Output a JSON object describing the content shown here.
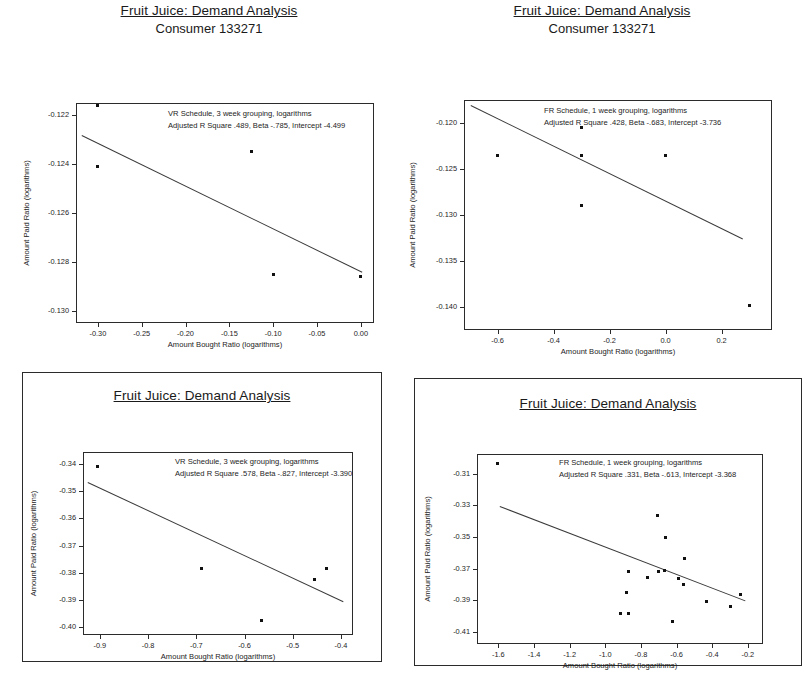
{
  "document": {
    "background_color": "#ffffff",
    "axis_color": "#2b2b2b",
    "marker_color": "#111111",
    "line_color": "#3a3a3a"
  },
  "charts": [
    {
      "id": "top-left",
      "title": "Fruit Juice: Demand Analysis",
      "subtitle": "Consumer 133271",
      "annotation_line1": "VR Schedule, 3 week grouping, logarithms",
      "annotation_line2": "Adjusted R Square .489, Beta -.785, Intercept -4.499",
      "xlabel": "Amount Bought Ratio (logarithms)",
      "ylabel": "Amount Paid Ratio (logarithms)",
      "xticks": [
        "-0.30",
        "-0.25",
        "-0.20",
        "-0.15",
        "-0.10",
        "-0.05",
        "0.00"
      ],
      "xtick_values": [
        -0.3,
        -0.25,
        -0.2,
        -0.15,
        -0.1,
        -0.05,
        0.0
      ],
      "yticks": [
        "-0.122",
        "-0.124",
        "-0.126",
        "-0.128",
        "-0.130"
      ],
      "ytick_values": [
        -0.122,
        -0.124,
        -0.126,
        -0.128,
        -0.13
      ],
      "xlim": [
        -0.325,
        0.015
      ],
      "ylim": [
        -0.1305,
        -0.1215
      ],
      "points": [
        {
          "x": -0.3,
          "y": -0.1216
        },
        {
          "x": -0.3,
          "y": -0.1241
        },
        {
          "x": -0.125,
          "y": -0.1235
        },
        {
          "x": -0.1,
          "y": -0.1285
        },
        {
          "x": 0.0,
          "y": -0.1286
        }
      ],
      "fit": {
        "x1": -0.318,
        "y1": -0.1228,
        "x2": 0.002,
        "y2": -0.1284
      }
    },
    {
      "id": "top-right",
      "title": "Fruit Juice: Demand Analysis",
      "subtitle": "Consumer 133271",
      "annotation_line1": "FR Schedule, 1 week grouping, logarithms",
      "annotation_line2": "Adjusted R Square .428, Beta -.683, Intercept -3.736",
      "xlabel": "Amount Bought Ratio (logarithms)",
      "ylabel": "Amount Paid Ratio (logarithms)",
      "xticks": [
        "-0.6",
        "-0.4",
        "-0.2",
        "0.0",
        "0.2"
      ],
      "xtick_values": [
        -0.6,
        -0.4,
        -0.2,
        0.0,
        0.2
      ],
      "yticks": [
        "-0.120",
        "-0.125",
        "-0.130",
        "-0.135",
        "-0.140"
      ],
      "ytick_values": [
        -0.12,
        -0.125,
        -0.13,
        -0.135,
        -0.14
      ],
      "xlim": [
        -0.72,
        0.38
      ],
      "ylim": [
        -0.1425,
        -0.1175
      ],
      "points": [
        {
          "x": -0.6,
          "y": -0.1235
        },
        {
          "x": -0.3,
          "y": -0.1205
        },
        {
          "x": -0.3,
          "y": -0.1235
        },
        {
          "x": -0.3,
          "y": -0.129
        },
        {
          "x": 0.0,
          "y": -0.1235
        },
        {
          "x": 0.3,
          "y": -0.1398
        }
      ],
      "fit": {
        "x1": -0.695,
        "y1": -0.118,
        "x2": 0.275,
        "y2": -0.1325
      }
    },
    {
      "id": "bottom-left",
      "title": "Fruit Juice: Demand Analysis",
      "subtitle": "",
      "annotation_line1": "VR Schedule, 3 week grouping, logarithms",
      "annotation_line2": "Adjusted R Square .578, Beta -.827, Intercept -3.390",
      "xlabel": "Amount Bought Ratio (logarithms)",
      "ylabel": "Amount Paid Ratio (logarithms)",
      "xticks": [
        "-0.9",
        "-0.8",
        "-0.7",
        "-0.6",
        "-0.5",
        "-0.4"
      ],
      "xtick_values": [
        -0.9,
        -0.8,
        -0.7,
        -0.6,
        -0.5,
        -0.4
      ],
      "yticks": [
        "-0.34",
        "-0.35",
        "-0.36",
        "-0.37",
        "-0.38",
        "-0.39",
        "-0.40"
      ],
      "ytick_values": [
        -0.34,
        -0.35,
        -0.36,
        -0.37,
        -0.38,
        -0.39,
        -0.4
      ],
      "xlim": [
        -0.935,
        -0.375
      ],
      "ylim": [
        -0.403,
        -0.3355
      ],
      "points": [
        {
          "x": -0.905,
          "y": -0.341
        },
        {
          "x": -0.69,
          "y": -0.3785
        },
        {
          "x": -0.565,
          "y": -0.3975
        },
        {
          "x": -0.455,
          "y": -0.3825
        },
        {
          "x": -0.43,
          "y": -0.3785
        }
      ],
      "fit": {
        "x1": -0.925,
        "y1": -0.3465,
        "x2": -0.395,
        "y2": -0.3905
      }
    },
    {
      "id": "bottom-right",
      "title": "Fruit Juice: Demand Analysis",
      "subtitle": "",
      "annotation_line1": "FR Schedule, 1 week grouping, logarithms",
      "annotation_line2": "Adjusted R Square .331, Beta -.613, Intercept -3.368",
      "xlabel": "Amount Bought Ratio (logarithms)",
      "ylabel": "Amount Paid Ratio (logarithms)",
      "xticks": [
        "-1.6",
        "-1.4",
        "-1.2",
        "-1.0",
        "-0.8",
        "-0.6",
        "-0.4",
        "-0.2"
      ],
      "xtick_values": [
        -1.6,
        -1.4,
        -1.2,
        -1.0,
        -0.8,
        -0.6,
        -0.4,
        -0.2
      ],
      "yticks": [
        "-0.31",
        "-0.33",
        "-0.35",
        "-0.37",
        "-0.39",
        "-0.41"
      ],
      "ytick_values": [
        -0.31,
        -0.33,
        -0.35,
        -0.37,
        -0.39,
        -0.41
      ],
      "xlim": [
        -1.72,
        -0.115
      ],
      "ylim": [
        -0.4175,
        -0.2975
      ],
      "points": [
        {
          "x": -1.605,
          "y": -0.3035
        },
        {
          "x": -0.705,
          "y": -0.3365
        },
        {
          "x": -0.66,
          "y": -0.3505
        },
        {
          "x": -0.555,
          "y": -0.3635
        },
        {
          "x": -0.87,
          "y": -0.372
        },
        {
          "x": -0.765,
          "y": -0.3755
        },
        {
          "x": -0.7,
          "y": -0.3715
        },
        {
          "x": -0.665,
          "y": -0.371
        },
        {
          "x": -0.59,
          "y": -0.376
        },
        {
          "x": -0.56,
          "y": -0.38
        },
        {
          "x": -0.88,
          "y": -0.385
        },
        {
          "x": -0.43,
          "y": -0.3905
        },
        {
          "x": -0.915,
          "y": -0.3985
        },
        {
          "x": -0.87,
          "y": -0.3985
        },
        {
          "x": -0.625,
          "y": -0.4035
        },
        {
          "x": -0.3,
          "y": -0.3935
        },
        {
          "x": -0.24,
          "y": -0.3865
        }
      ],
      "fit": {
        "x1": -1.59,
        "y1": -0.3305,
        "x2": -0.215,
        "y2": -0.39
      }
    }
  ]
}
